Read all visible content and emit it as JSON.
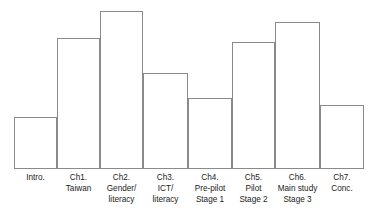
{
  "chart_data": {
    "type": "bar",
    "title": "",
    "subtitle": "",
    "xlabel": "",
    "ylabel": "",
    "grid": false,
    "legend": "none",
    "axis_style": "baseline-only, outlined white bars, contiguous columns",
    "ylim": [
      0,
      100
    ],
    "categories": [
      "Intro.",
      "Ch1. Taiwan",
      "Ch2. Gender/ literacy",
      "Ch3. ICT/ literacy",
      "Ch4. Pre-pilot Stage 1",
      "Ch5. Pilot Stage 2",
      "Ch6. Main study Stage 3",
      "Ch7. Conc."
    ],
    "values": [
      33,
      83,
      100,
      60,
      45,
      45,
      80,
      40
    ],
    "tick_labels": [
      [
        "Intro."
      ],
      [
        "Ch1.",
        "Taiwan"
      ],
      [
        "Ch2.",
        "Gender/",
        "literacy"
      ],
      [
        "Ch3.",
        "ICT/",
        "literacy"
      ],
      [
        "Ch4.",
        "Pre-pilot",
        "Stage 1"
      ],
      [
        "Ch5.",
        "Pilot",
        "Stage 2"
      ],
      [
        "Ch6.",
        "Main study",
        "Stage 3"
      ],
      [
        "Ch7.",
        "Conc."
      ]
    ],
    "annotations": []
  },
  "colors": {
    "bar_fill": "#ffffff",
    "bar_stroke": "#8a8a8a",
    "baseline": "#8a8a8a",
    "label_text": "#1a1a1a",
    "background": "#ffffff"
  },
  "bars": [
    {
      "name": "intro",
      "left": 14,
      "width": 43,
      "top": 117,
      "height": 51,
      "label_lines": [
        "Intro."
      ]
    },
    {
      "name": "ch1",
      "left": 57,
      "width": 43,
      "top": 38,
      "height": 130,
      "label_lines": [
        "Ch1.",
        "Taiwan"
      ]
    },
    {
      "name": "ch2",
      "left": 100,
      "width": 43,
      "top": 11,
      "height": 157,
      "label_lines": [
        "Ch2.",
        "Gender/",
        "literacy"
      ]
    },
    {
      "name": "ch3",
      "left": 143,
      "width": 45,
      "top": 73,
      "height": 95,
      "label_lines": [
        "Ch3.",
        "ICT/",
        "literacy"
      ]
    },
    {
      "name": "ch4",
      "left": 188,
      "width": 44,
      "top": 98,
      "height": 70,
      "label_lines": [
        "Ch4.",
        "Pre-pilot",
        "Stage 1"
      ]
    },
    {
      "name": "ch5",
      "left": 232,
      "width": 43,
      "top": 42,
      "height": 126,
      "label_lines": [
        "Ch5.",
        "Pilot",
        "Stage 2"
      ]
    },
    {
      "name": "ch6",
      "left": 275,
      "width": 45,
      "top": 22,
      "height": 146,
      "label_lines": [
        "Ch6.",
        "Main study",
        "Stage 3"
      ]
    },
    {
      "name": "ch7",
      "left": 320,
      "width": 44,
      "top": 105,
      "height": 63,
      "label_lines": [
        "Ch7.",
        "Conc."
      ]
    }
  ]
}
